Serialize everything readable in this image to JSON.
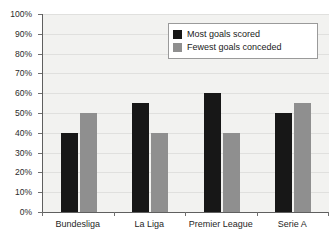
{
  "chart_data": {
    "type": "bar",
    "title": "",
    "xlabel": "",
    "ylabel": "",
    "categories": [
      "Bundesliga",
      "La Liga",
      "Premier League",
      "Serie A"
    ],
    "series": [
      {
        "name": "Most goals scored",
        "color": "#171717",
        "values": [
          40,
          55,
          60,
          50
        ]
      },
      {
        "name": "Fewest goals conceded",
        "color": "#8f8f8f",
        "values": [
          50,
          40,
          40,
          55
        ]
      }
    ],
    "ylim": [
      0,
      100
    ],
    "ytick_step": 10,
    "ytick_labels": [
      "0%",
      "10%",
      "20%",
      "30%",
      "40%",
      "50%",
      "60%",
      "70%",
      "80%",
      "90%",
      "100%"
    ],
    "grid": true,
    "legend_position": "top-right",
    "plot_background": "#f2f2f0",
    "axis_color": "#5f5f5f",
    "gridline_color": "#e0e0de"
  },
  "legend": {
    "entries": [
      {
        "label": "Most goals scored"
      },
      {
        "label": "Fewest goals conceded"
      }
    ]
  }
}
